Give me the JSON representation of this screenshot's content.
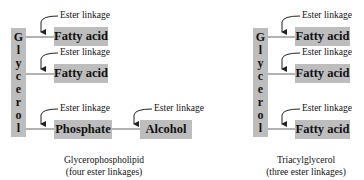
{
  "left_structure": {
    "glycerol_letters": [
      "G",
      "l",
      "y",
      "c",
      "e",
      "r",
      "o",
      "l"
    ],
    "components": [
      {
        "label": "Fatty acid",
        "linkage_label": "Ester linkage"
      },
      {
        "label": "Fatty acid",
        "linkage_label": "Ester linkage"
      },
      {
        "label": "Phosphate",
        "linkage_label": "Ester linkage"
      },
      {
        "label": "Alcohol",
        "linkage_label": "Ester linkage"
      }
    ],
    "caption_line1": "Glycerophospholipid",
    "caption_line2": "(four ester linkages)"
  },
  "right_structure": {
    "glycerol_letters": [
      "G",
      "l",
      "y",
      "c",
      "e",
      "r",
      "o",
      "l"
    ],
    "components": [
      {
        "label": "Fatty acid",
        "linkage_label": "Ester linkage"
      },
      {
        "label": "Fatty acid",
        "linkage_label": "Ester linkage"
      },
      {
        "label": "Fatty acid",
        "linkage_label": "Ester linkage"
      }
    ],
    "caption_line1": "Triacylglycerol",
    "caption_line2": "(three ester linkages)"
  },
  "colors": {
    "box_fill": "#bdbdbd",
    "line": "#555555",
    "text": "#111111"
  }
}
